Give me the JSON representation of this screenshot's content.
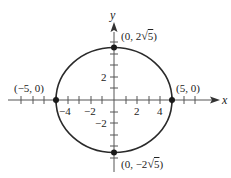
{
  "diagram": {
    "type": "ellipse-graph",
    "equation_implied": "x^2/25 + y^2/20 = 1",
    "axes": {
      "x_label": "x",
      "y_label": "y",
      "x_tick_labels": [
        "−4",
        "−2",
        "2",
        "4"
      ],
      "y_tick_labels": [
        "2",
        "−2"
      ]
    },
    "points": [
      {
        "label": "(−5, 0)",
        "x": -5,
        "y": 0
      },
      {
        "label": "(5, 0)",
        "x": 5,
        "y": 0
      },
      {
        "label_prefix": "(0, 2",
        "label_radical": "5",
        "label_suffix": ")",
        "x": 0,
        "y": 4.472
      },
      {
        "label_prefix": "(0, −2",
        "label_radical": "5",
        "label_suffix": ")",
        "x": 0,
        "y": -4.472
      }
    ],
    "colors": {
      "stroke": "#2a2a2a",
      "point": "#1a1a1a",
      "axis": "#555555"
    }
  }
}
